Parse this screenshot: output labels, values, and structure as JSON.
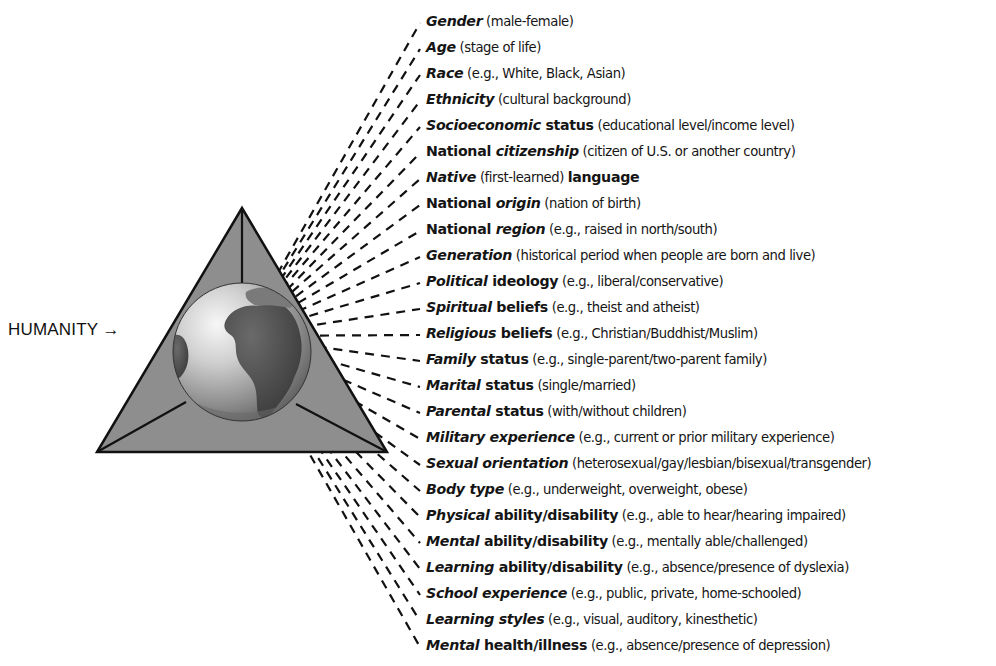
{
  "diagram": {
    "center_label": "HUMANITY",
    "center_arrow": "→",
    "center_image": "globe-icon",
    "colors": {
      "triangle_fill": "#8e8e8e",
      "triangle_stroke": "#111111",
      "globe_land": "#4a4a4a",
      "globe_ocean_light": "#f2f2f2",
      "globe_ocean_dark": "#6a6a6a",
      "dash": "#111111",
      "text": "#151515"
    },
    "items": [
      {
        "parts": [
          {
            "t": "Gender",
            "s": "bi"
          },
          {
            "t": " (male-female)",
            "s": "d"
          }
        ]
      },
      {
        "parts": [
          {
            "t": "Age",
            "s": "bi"
          },
          {
            "t": " (stage of life)",
            "s": "d"
          }
        ]
      },
      {
        "parts": [
          {
            "t": "Race",
            "s": "bi"
          },
          {
            "t": " (e.g., White, Black, Asian)",
            "s": "d"
          }
        ]
      },
      {
        "parts": [
          {
            "t": "Ethnicity",
            "s": "bi"
          },
          {
            "t": " (cultural background)",
            "s": "d"
          }
        ]
      },
      {
        "parts": [
          {
            "t": "Socioeconomic",
            "s": "bi"
          },
          {
            "t": " status",
            "s": "b"
          },
          {
            "t": " (educational level/income level)",
            "s": "d"
          }
        ]
      },
      {
        "parts": [
          {
            "t": "National ",
            "s": "b"
          },
          {
            "t": "citizenship",
            "s": "bi"
          },
          {
            "t": " (citizen of U.S. or another country)",
            "s": "d"
          }
        ]
      },
      {
        "parts": [
          {
            "t": "Native",
            "s": "bi"
          },
          {
            "t": " (first-learned) ",
            "s": "d"
          },
          {
            "t": "language",
            "s": "b"
          }
        ]
      },
      {
        "parts": [
          {
            "t": "National ",
            "s": "b"
          },
          {
            "t": "origin",
            "s": "bi"
          },
          {
            "t": " (nation of birth)",
            "s": "d"
          }
        ]
      },
      {
        "parts": [
          {
            "t": "National ",
            "s": "b"
          },
          {
            "t": "region",
            "s": "bi"
          },
          {
            "t": " (e.g., raised in north/south)",
            "s": "d"
          }
        ]
      },
      {
        "parts": [
          {
            "t": "Generation",
            "s": "bi"
          },
          {
            "t": " (historical period when people are born and live)",
            "s": "d"
          }
        ]
      },
      {
        "parts": [
          {
            "t": "Political",
            "s": "bi"
          },
          {
            "t": " ideology",
            "s": "b"
          },
          {
            "t": " (e.g., liberal/conservative)",
            "s": "d"
          }
        ]
      },
      {
        "parts": [
          {
            "t": "Spiritual",
            "s": "bi"
          },
          {
            "t": " beliefs",
            "s": "b"
          },
          {
            "t": " (e.g., theist and atheist)",
            "s": "d"
          }
        ]
      },
      {
        "parts": [
          {
            "t": "Religious",
            "s": "bi"
          },
          {
            "t": " beliefs",
            "s": "b"
          },
          {
            "t": " (e.g., Christian/Buddhist/Muslim)",
            "s": "d"
          }
        ]
      },
      {
        "parts": [
          {
            "t": "Family",
            "s": "bi"
          },
          {
            "t": " status",
            "s": "b"
          },
          {
            "t": " (e.g., single-parent/two-parent family)",
            "s": "d"
          }
        ]
      },
      {
        "parts": [
          {
            "t": "Marital",
            "s": "bi"
          },
          {
            "t": " status",
            "s": "b"
          },
          {
            "t": " (single/married)",
            "s": "d"
          }
        ]
      },
      {
        "parts": [
          {
            "t": "Parental",
            "s": "bi"
          },
          {
            "t": " status",
            "s": "b"
          },
          {
            "t": " (with/without children)",
            "s": "d"
          }
        ]
      },
      {
        "parts": [
          {
            "t": "Military experience",
            "s": "bi"
          },
          {
            "t": " (e.g., current or prior military experience)",
            "s": "d"
          }
        ]
      },
      {
        "parts": [
          {
            "t": "Sexual orientation",
            "s": "bi"
          },
          {
            "t": " (heterosexual/gay/lesbian/bisexual/transgender)",
            "s": "d"
          }
        ]
      },
      {
        "parts": [
          {
            "t": "Body type",
            "s": "bi"
          },
          {
            "t": " (e.g., underweight, overweight, obese)",
            "s": "d"
          }
        ]
      },
      {
        "parts": [
          {
            "t": "Physical",
            "s": "bi"
          },
          {
            "t": " ability/disability",
            "s": "b"
          },
          {
            "t": " (e.g., able to hear/hearing impaired)",
            "s": "d"
          }
        ]
      },
      {
        "parts": [
          {
            "t": "Mental",
            "s": "bi"
          },
          {
            "t": " ability/disability",
            "s": "b"
          },
          {
            "t": " (e.g., mentally able/challenged)",
            "s": "d"
          }
        ]
      },
      {
        "parts": [
          {
            "t": "Learning",
            "s": "bi"
          },
          {
            "t": " ability/disability",
            "s": "b"
          },
          {
            "t": " (e.g., absence/presence of dyslexia)",
            "s": "d"
          }
        ]
      },
      {
        "parts": [
          {
            "t": "School experience",
            "s": "bi"
          },
          {
            "t": " (e.g., public, private, home-schooled)",
            "s": "d"
          }
        ]
      },
      {
        "parts": [
          {
            "t": "Learning styles",
            "s": "bi"
          },
          {
            "t": " (e.g., visual, auditory, kinesthetic)",
            "s": "d"
          }
        ]
      },
      {
        "parts": [
          {
            "t": "Mental",
            "s": "bi"
          },
          {
            "t": " health/illness",
            "s": "b"
          },
          {
            "t": " (e.g., absence/presence of depression)",
            "s": "d"
          }
        ]
      }
    ]
  }
}
